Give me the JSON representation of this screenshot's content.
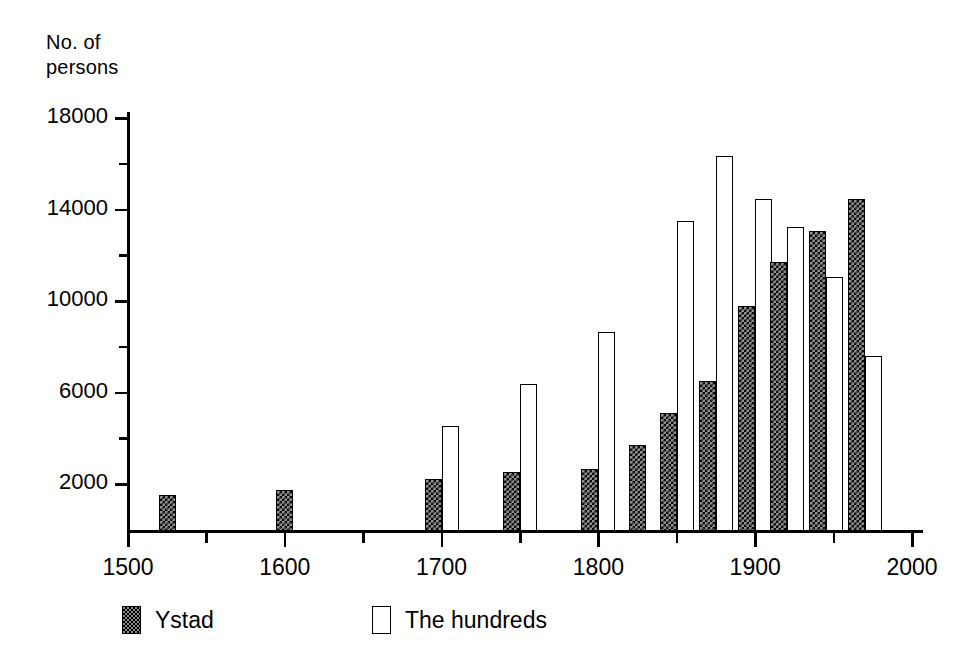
{
  "chart_data": {
    "type": "bar",
    "title": "",
    "ylabel": "No. of\npersons",
    "xlabel": "",
    "x": [
      1525,
      1600,
      1700,
      1750,
      1800,
      1825,
      1850,
      1875,
      1900,
      1920,
      1945,
      1970
    ],
    "categories": [
      "1525",
      "1600",
      "1700",
      "1750",
      "1800",
      "1825",
      "1850",
      "1875",
      "1900",
      "1920",
      "1945",
      "1970"
    ],
    "series": [
      {
        "name": "Ystad",
        "style": "checkered",
        "values": [
          1550,
          1750,
          2250,
          2550,
          2650,
          3700,
          5100,
          6500,
          9800,
          11700,
          13050,
          14450
        ]
      },
      {
        "name": "The hundreds",
        "style": "outline",
        "values": [
          null,
          null,
          4550,
          6400,
          8650,
          null,
          13500,
          16350,
          14450,
          13250,
          11050,
          7600
        ]
      }
    ],
    "xlim": [
      1500,
      2000
    ],
    "ylim": [
      0,
      18800
    ],
    "x_ticks_major": [
      1500,
      1600,
      1700,
      1800,
      1900,
      2000
    ],
    "x_ticks_minor": [
      1550,
      1650,
      1750,
      1850,
      1950
    ],
    "x_tick_labels": [
      "1500",
      "1600",
      "1700",
      "1800",
      "1900",
      "2000"
    ],
    "y_ticks_major": [
      2000,
      6000,
      10000,
      14000,
      18000
    ],
    "y_ticks_minor": [
      4000,
      8000,
      12000,
      16000
    ],
    "y_tick_labels": [
      "2000",
      "6000",
      "10000",
      "14000",
      "18000"
    ],
    "grid": false,
    "legend_position": "bottom",
    "colors": {
      "axis": "#000000",
      "ystad_fill": "#8e8e8e",
      "hundreds_fill": "#ffffff",
      "outline": "#000000"
    }
  },
  "legend": {
    "items": [
      {
        "label": "Ystad",
        "style": "hatch"
      },
      {
        "label": "The hundreds",
        "style": "plain"
      }
    ]
  }
}
